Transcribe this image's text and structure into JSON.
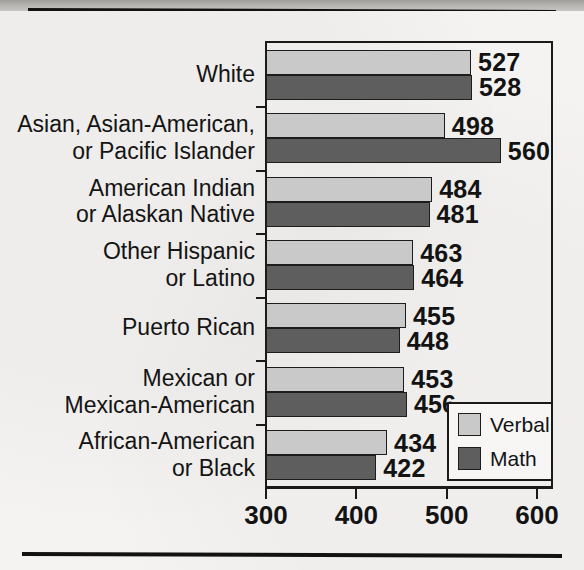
{
  "chart_data": {
    "type": "bar",
    "orientation": "horizontal",
    "title": "",
    "xlabel": "",
    "ylabel": "",
    "xlim": [
      300,
      600
    ],
    "xticks": [
      300,
      400,
      500,
      600
    ],
    "xtick_labels": [
      "300",
      "400",
      "500",
      "600"
    ],
    "grid": false,
    "legend_position": "bottom-right",
    "categories": [
      "White",
      "Asian, Asian-American,\nor Pacific Islander",
      "American Indian\nor Alaskan Native",
      "Other Hispanic\nor Latino",
      "Puerto Rican",
      "Mexican or\nMexican-American",
      "African-American\nor Black"
    ],
    "series": [
      {
        "name": "Verbal",
        "color": "#c9c9c9",
        "values": [
          527,
          498,
          484,
          463,
          455,
          453,
          434
        ]
      },
      {
        "name": "Math",
        "color": "#5e5e5e",
        "values": [
          528,
          560,
          481,
          464,
          448,
          456,
          422
        ]
      }
    ]
  },
  "legend": {
    "entries": [
      {
        "label": "Verbal",
        "swatch": "verbal-swatch"
      },
      {
        "label": "Math",
        "swatch": "math-swatch"
      }
    ]
  },
  "colors": {
    "verbal": "#c9c9c9",
    "math": "#5e5e5e",
    "ink": "#131313",
    "paper": "#f4f3f1"
  }
}
